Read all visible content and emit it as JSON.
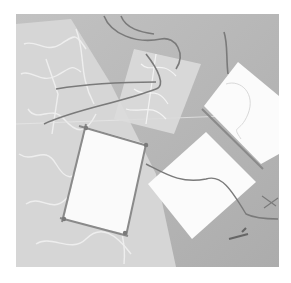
{
  "image": {
    "subject": "Handmade paper crafts: mulberry paper sheets, white paper squares bound with twine",
    "colors": {
      "page_background": "#ffffff",
      "backdrop": "#b4b4b4",
      "mulberry_paper": "#d9d9d9",
      "fiber_lines": "#f2f2f2",
      "white_paper": "#fbfbfb",
      "twine": "#7a7a7a"
    },
    "objects": [
      {
        "name": "mulberry-paper-sheet-left",
        "label": "large translucent fibrous paper sheet"
      },
      {
        "name": "mulberry-paper-sheet-center",
        "label": "translucent fibrous paper strip"
      },
      {
        "name": "bound-paper-frame",
        "label": "white paper bordered with twine sticks tied at corners"
      },
      {
        "name": "white-paper-top-right",
        "label": "white paper with twine binding on left edge"
      },
      {
        "name": "white-paper-bottom-right",
        "label": "white paper diamond with twine crossing"
      },
      {
        "name": "loose-twine",
        "label": "loose twine strands"
      },
      {
        "name": "small-twine-bundle",
        "label": "small bundle of twine pieces"
      }
    ]
  }
}
